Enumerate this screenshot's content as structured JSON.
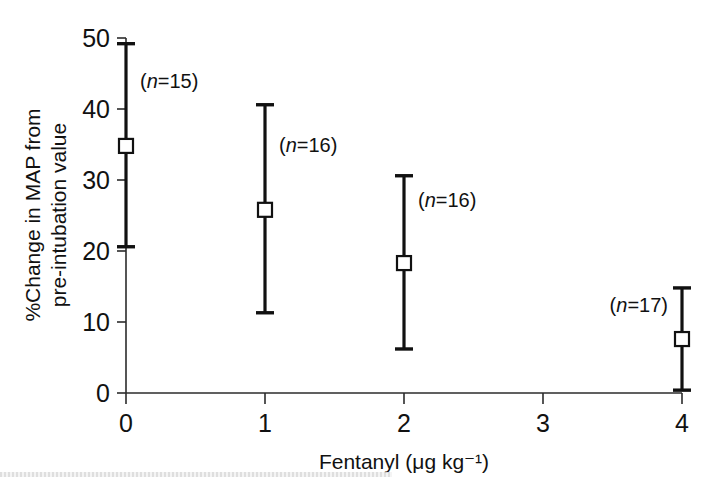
{
  "chart_data": {
    "type": "scatter",
    "title": "",
    "xlabel": "Fentanyl  (μg kg⁻¹)",
    "ylabel_line1": "%Change in MAP from",
    "ylabel_line2": "pre-intubation value",
    "xlim": [
      0,
      4
    ],
    "ylim": [
      0,
      50
    ],
    "xticks": [
      0,
      1,
      2,
      3,
      4
    ],
    "xtick_labels": [
      "0",
      "1",
      "2",
      "3",
      "4"
    ],
    "yticks": [
      0,
      10,
      20,
      30,
      40,
      50
    ],
    "ytick_labels": [
      "0",
      "10",
      "20",
      "30",
      "40",
      "50"
    ],
    "grid": false,
    "legend": "none",
    "marker_style": "open-square",
    "error_bar_style": "capped-vertical",
    "x": [
      0,
      1,
      2,
      4
    ],
    "values": [
      34.8,
      25.8,
      18.3,
      7.6
    ],
    "err_low": [
      20.6,
      11.3,
      6.2,
      0.4
    ],
    "err_high": [
      49.2,
      40.6,
      30.6,
      14.8
    ],
    "annotations": [
      {
        "text_prefix": "(",
        "text_italic": "n",
        "text_suffix": "=15)",
        "label": "(n=15)",
        "x": 0,
        "y": 43.0,
        "side": "right"
      },
      {
        "text_prefix": "(",
        "text_italic": "n",
        "text_suffix": "=16)",
        "label": "(n=16)",
        "x": 1,
        "y": 34.0,
        "side": "right"
      },
      {
        "text_prefix": "(",
        "text_italic": "n",
        "text_suffix": "=16)",
        "label": "(n=16)",
        "x": 2,
        "y": 26.2,
        "side": "right"
      },
      {
        "text_prefix": "(",
        "text_italic": "n",
        "text_suffix": "=17)",
        "label": "(n=17)",
        "x": 4,
        "y": 11.4,
        "side": "left"
      }
    ]
  },
  "colors": {
    "background": "#ffffff",
    "axis": "#2b2b2b",
    "data": "#111111",
    "marker_fill": "#ffffff"
  }
}
